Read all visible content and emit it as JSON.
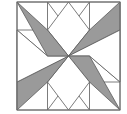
{
  "figure": {
    "label": "b.",
    "kind": "quilt-block-diagram"
  },
  "colors": {
    "shaded": "#9a9a9a",
    "unshaded": "#ffffff",
    "outline": "#5a5a5a",
    "frame": "#6e6e6e",
    "background": "#ffffff",
    "label_text": "#1a1a1a"
  },
  "geometry": {
    "frame": {
      "x": 17,
      "y": 2,
      "width": 103,
      "height": 108
    },
    "center": {
      "x": 68.5,
      "y": 56
    },
    "edge_points": {
      "top": {
        "x": 68.5,
        "y": 2
      },
      "right": {
        "x": 120,
        "y": 56
      },
      "bottom": {
        "x": 68.5,
        "y": 110
      },
      "left": {
        "x": 17,
        "y": 56
      }
    },
    "corner_points": {
      "top_left": {
        "x": 17,
        "y": 2
      },
      "top_right": {
        "x": 120,
        "y": 2
      },
      "bottom_right": {
        "x": 120,
        "y": 110
      },
      "bottom_left": {
        "x": 17,
        "y": 110
      }
    },
    "inner_points": {
      "top_left_inner": {
        "x": 47.5,
        "y": 30
      },
      "top_right_inner": {
        "x": 89.5,
        "y": 30
      },
      "bottom_right_inner": {
        "x": 89.5,
        "y": 82
      },
      "bottom_left_inner": {
        "x": 47.5,
        "y": 82
      }
    }
  },
  "shapes": {
    "corner_squares": [
      {
        "name": "corner-square-top-left",
        "fill": "unshaded",
        "points": "17,2 47.5,2 47.5,30 17,30"
      },
      {
        "name": "corner-square-top-right",
        "fill": "unshaded",
        "points": "89.5,2 120,2 120,30 89.5,30"
      },
      {
        "name": "corner-square-bottom-right",
        "fill": "unshaded",
        "points": "89.5,82 120,82 120,110 89.5,110"
      },
      {
        "name": "corner-square-bottom-left",
        "fill": "unshaded",
        "points": "17,82 47.5,82 47.5,110 17,110"
      }
    ],
    "edge_triangles": [
      {
        "name": "edge-triangle-top",
        "fill": "unshaded",
        "points": "47.5,2 89.5,2 68.5,30"
      },
      {
        "name": "edge-triangle-right",
        "fill": "unshaded",
        "points": "120,30 120,82 89.5,56"
      },
      {
        "name": "edge-triangle-bottom",
        "fill": "unshaded",
        "points": "47.5,110 89.5,110 68.5,82"
      },
      {
        "name": "edge-triangle-left",
        "fill": "unshaded",
        "points": "17,30 17,82 47.5,56"
      }
    ],
    "star_diamonds": [
      {
        "name": "star-diamond-n",
        "fill": "unshaded",
        "points": "68.5,56 47.5,30 68.5,2 89.5,30"
      },
      {
        "name": "star-diamond-ne",
        "fill": "shaded",
        "points": "68.5,56 89.5,30 120,2 120,30"
      },
      {
        "name": "star-diamond-e",
        "fill": "unshaded",
        "points": "68.5,56 120,30 120,82 89.5,56"
      },
      {
        "name": "star-diamond-se",
        "fill": "shaded",
        "points": "68.5,56 89.5,56 120,110 89.5,82"
      },
      {
        "name": "star-diamond-s",
        "fill": "unshaded",
        "points": "68.5,56 89.5,82 68.5,110 47.5,82"
      },
      {
        "name": "star-diamond-sw",
        "fill": "shaded",
        "points": "68.5,56 47.5,82 17,110 17,82"
      },
      {
        "name": "star-diamond-w",
        "fill": "unshaded",
        "points": "68.5,56 17,82 17,30 47.5,56"
      },
      {
        "name": "star-diamond-nw",
        "fill": "shaded",
        "points": "68.5,56 47.5,56 17,2 47.5,30"
      }
    ]
  },
  "counts": {
    "shaded_pieces": 4,
    "unshaded_pieces": 12,
    "total_pieces": 16,
    "star_points": 8
  }
}
